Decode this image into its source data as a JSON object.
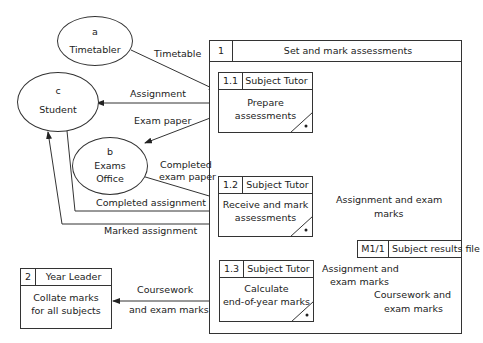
{
  "external_entities": [
    {
      "id": "a",
      "name": "Timetabler"
    },
    {
      "id": "c",
      "name": "Student"
    },
    {
      "id": "b",
      "name_line1": "Exams",
      "name_line2": "Office"
    }
  ],
  "parent_process": {
    "number": "1",
    "title": "Set and mark assessments"
  },
  "processes": [
    {
      "number": "1.1",
      "actor": "Subject Tutor",
      "line1": "Prepare",
      "line2": "assessments"
    },
    {
      "number": "1.2",
      "actor": "Subject Tutor",
      "line1": "Receive and mark",
      "line2": "assessments"
    },
    {
      "number": "1.3",
      "actor": "Subject Tutor",
      "line1": "Calculate",
      "line2": "end-of-year marks"
    },
    {
      "number": "2",
      "actor": "Year Leader",
      "line1": "Collate marks",
      "line2": "for all subjects"
    }
  ],
  "data_store": {
    "id": "M1/1",
    "name": "Subject results file"
  },
  "flows": {
    "timetable": "Timetable",
    "assignment": "Assignment",
    "exam_paper": "Exam paper",
    "completed_exam_paper_1": "Completed",
    "completed_exam_paper_2": "exam paper",
    "completed_assignment": "Completed assignment",
    "marked_assignment": "Marked assignment",
    "assign_exam_marks_to_store_1": "Assignment and exam",
    "assign_exam_marks_to_store_2": "marks",
    "assign_exam_marks_from_store_1": "Assignment and",
    "assign_exam_marks_from_store_2": "exam marks",
    "coursework_exam_to_store_1": "Coursework and",
    "coursework_exam_to_store_2": "exam marks",
    "coursework_to_leader_1": "Coursework",
    "coursework_to_leader_2": "and exam marks"
  }
}
